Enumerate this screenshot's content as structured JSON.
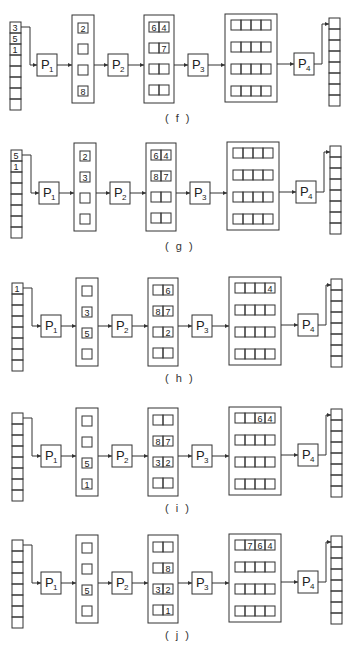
{
  "figure": {
    "processors": [
      "P1",
      "P2",
      "P3",
      "P4"
    ],
    "panels": [
      {
        "id": "f",
        "label": "( f )",
        "input_queue": [
          "3",
          "5",
          "1",
          "",
          "",
          "",
          "",
          ""
        ],
        "stage1": [
          "2",
          "",
          "",
          "8"
        ],
        "stage2": [
          [
            "6",
            "4"
          ],
          [
            "",
            "7"
          ],
          [
            "",
            ""
          ],
          [
            "",
            ""
          ]
        ],
        "stage3": [
          [
            "",
            "",
            "",
            ""
          ],
          [
            "",
            "",
            "",
            ""
          ],
          [
            "",
            "",
            "",
            ""
          ],
          [
            "",
            "",
            "",
            ""
          ]
        ],
        "output_queue": [
          "",
          "",
          "",
          "",
          "",
          "",
          "",
          ""
        ]
      },
      {
        "id": "g",
        "label": "( g )",
        "input_queue": [
          "5",
          "1",
          "",
          "",
          "",
          "",
          "",
          ""
        ],
        "stage1": [
          "2",
          "3",
          "",
          ""
        ],
        "stage2": [
          [
            "6",
            "4"
          ],
          [
            "8",
            "7"
          ],
          [
            "",
            ""
          ],
          [
            "",
            ""
          ]
        ],
        "stage3": [
          [
            "",
            "",
            "",
            ""
          ],
          [
            "",
            "",
            "",
            ""
          ],
          [
            "",
            "",
            "",
            ""
          ],
          [
            "",
            "",
            "",
            ""
          ]
        ],
        "output_queue": [
          "",
          "",
          "",
          "",
          "",
          "",
          "",
          ""
        ]
      },
      {
        "id": "h",
        "label": "( h )",
        "input_queue": [
          "1",
          "",
          "",
          "",
          "",
          "",
          "",
          ""
        ],
        "stage1": [
          "",
          "3",
          "5",
          ""
        ],
        "stage2": [
          [
            "",
            "6"
          ],
          [
            "8",
            "7"
          ],
          [
            "",
            "2"
          ],
          [
            "",
            ""
          ]
        ],
        "stage3": [
          [
            "",
            "",
            "",
            "4"
          ],
          [
            "",
            "",
            "",
            ""
          ],
          [
            "",
            "",
            "",
            ""
          ],
          [
            "",
            "",
            "",
            ""
          ]
        ],
        "output_queue": [
          "",
          "",
          "",
          "",
          "",
          "",
          "",
          ""
        ]
      },
      {
        "id": "i",
        "label": "( i )",
        "input_queue": [
          "",
          "",
          "",
          "",
          "",
          "",
          "",
          ""
        ],
        "stage1": [
          "",
          "",
          "5",
          "1"
        ],
        "stage2": [
          [
            "",
            ""
          ],
          [
            "8",
            "7"
          ],
          [
            "3",
            "2"
          ],
          [
            "",
            ""
          ]
        ],
        "stage3": [
          [
            "",
            "",
            "6",
            "4"
          ],
          [
            "",
            "",
            "",
            ""
          ],
          [
            "",
            "",
            "",
            ""
          ],
          [
            "",
            "",
            "",
            ""
          ]
        ],
        "output_queue": [
          "",
          "",
          "",
          "",
          "",
          "",
          "",
          ""
        ]
      },
      {
        "id": "j",
        "label": "( j )",
        "input_queue": [
          "",
          "",
          "",
          "",
          "",
          "",
          "",
          ""
        ],
        "stage1": [
          "",
          "",
          "5",
          ""
        ],
        "stage2": [
          [
            "",
            ""
          ],
          [
            "",
            "8"
          ],
          [
            "3",
            "2"
          ],
          [
            "",
            "1"
          ]
        ],
        "stage3": [
          [
            "",
            "7",
            "6",
            "4"
          ],
          [
            "",
            "",
            "",
            ""
          ],
          [
            "",
            "",
            "",
            ""
          ],
          [
            "",
            "",
            "",
            ""
          ]
        ],
        "output_queue": [
          "",
          "",
          "",
          "",
          "",
          "",
          "",
          ""
        ]
      }
    ]
  }
}
